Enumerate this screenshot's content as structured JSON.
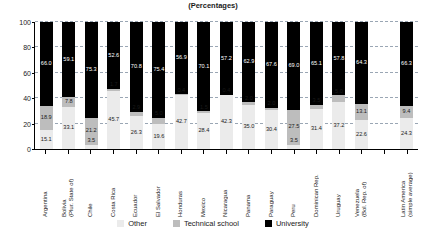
{
  "chart_title": "",
  "chart_subtitle": "(Percentages)",
  "legend": {
    "position": "bottom",
    "items": [
      {
        "label": "Other",
        "color": "#ebebeb",
        "key": "other"
      },
      {
        "label": "Technical school",
        "color": "#bdbdbd",
        "key": "technical"
      },
      {
        "label": "University",
        "color": "#000000",
        "key": "university"
      }
    ]
  },
  "yaxis": {
    "ticks": [
      "0",
      "20",
      "40",
      "60",
      "80",
      "100"
    ],
    "min": 0,
    "max": 100,
    "grid": true
  },
  "chart_data": {
    "type": "bar",
    "subtype": "stacked-vertical-100",
    "title": "(Percentages)",
    "xlabel": "",
    "ylabel": "",
    "ylim": [
      0,
      100
    ],
    "yticks": [
      0,
      20,
      40,
      60,
      80,
      100
    ],
    "grid": true,
    "legend_position": "bottom",
    "stack_order_bottom_to_top": [
      "Other",
      "Technical school",
      "University"
    ],
    "categories": [
      "Argentina",
      "Bolivia\n(Plur. State of)",
      "Chile",
      "Costa Rica",
      "Ecuador",
      "El Salvador",
      "Honduras",
      "Mexico",
      "Nicaragua",
      "Panama",
      "Paraguay",
      "Peru",
      "Dominican Rep.",
      "Uruguay",
      "Venezuela\n(Bol. Rep. of)",
      "",
      "Latin America\n(simple average)"
    ],
    "series": [
      {
        "name": "Other",
        "color": "#ebebeb",
        "values": [
          15.1,
          33.1,
          3.5,
          45.7,
          26.3,
          19.6,
          42.7,
          28.4,
          42.3,
          35.0,
          30.4,
          3.5,
          31.4,
          37.2,
          22.6,
          null,
          24.3
        ]
      },
      {
        "name": "Technical school",
        "color": "#bdbdbd",
        "values": [
          18.9,
          7.8,
          21.2,
          1.7,
          2.9,
          5.0,
          0.4,
          1.5,
          0.4,
          2.0,
          2.0,
          27.5,
          3.5,
          5.0,
          13.1,
          null,
          9.4
        ]
      },
      {
        "name": "University",
        "color": "#000000",
        "values": [
          66.0,
          59.1,
          75.3,
          52.6,
          70.8,
          75.4,
          56.9,
          70.1,
          57.2,
          62.9,
          67.6,
          69.0,
          65.1,
          57.8,
          64.3,
          null,
          66.3
        ]
      }
    ]
  }
}
